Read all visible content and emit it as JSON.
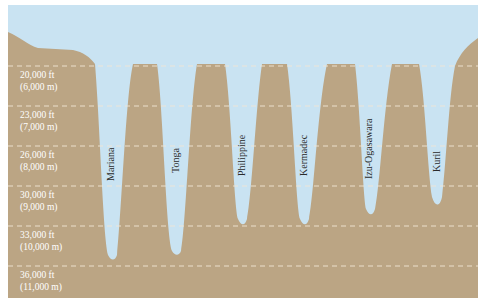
{
  "colors": {
    "water": "#c9e3f2",
    "land": "#bba584",
    "dash": "#f2e8d6",
    "label_text": "#ffffff",
    "trench_text": "#2b2b2b"
  },
  "depth_levels": [
    {
      "ft": "20,000 ft",
      "m": "(6,000 m)"
    },
    {
      "ft": "23,000 ft",
      "m": "(7,000 m)"
    },
    {
      "ft": "26,000 ft",
      "m": "(8,000 m)"
    },
    {
      "ft": "30,000 ft",
      "m": "(9,000 m)"
    },
    {
      "ft": "33,000 ft",
      "m": "(10,000 m)"
    },
    {
      "ft": "36,000 ft",
      "m": "(11,000 m)"
    }
  ],
  "trenches": [
    {
      "name": "Mariana"
    },
    {
      "name": "Tonga"
    },
    {
      "name": "Philippine"
    },
    {
      "name": "Kermadec"
    },
    {
      "name": "Izu-Ogasawara"
    },
    {
      "name": "Kuril"
    }
  ]
}
